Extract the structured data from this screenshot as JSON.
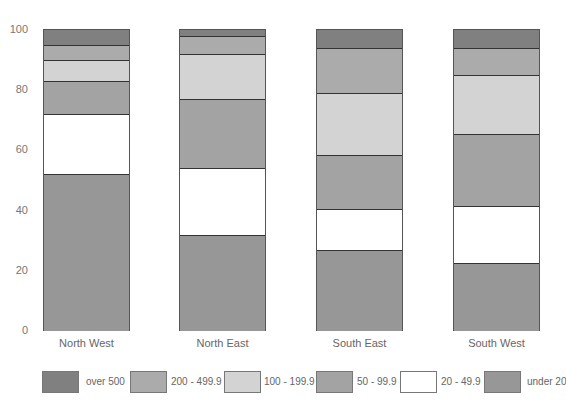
{
  "chart_data": {
    "type": "bar",
    "stacked": true,
    "title": "",
    "xlabel": "",
    "ylabel": "",
    "ylim": [
      0,
      100
    ],
    "yticks": [
      0,
      20,
      40,
      60,
      80,
      100
    ],
    "grid": false,
    "legend_position": "bottom",
    "categories": [
      "North West",
      "North East",
      "South East",
      "South West"
    ],
    "series": [
      {
        "name": "under 20",
        "color": "#979797",
        "values": [
          52,
          32,
          27,
          22.5
        ]
      },
      {
        "name": "20 - 49.9",
        "color": "#ffffff",
        "values": [
          20,
          22,
          13.5,
          19
        ]
      },
      {
        "name": "50 - 99.9",
        "color": "#a3a3a3",
        "values": [
          11,
          23,
          18,
          24
        ]
      },
      {
        "name": "100 - 199.9",
        "color": "#d3d3d3",
        "values": [
          7,
          15,
          20.5,
          19.5
        ]
      },
      {
        "name": "200 - 499.9",
        "color": "#ababab",
        "values": [
          5,
          6,
          15,
          9
        ]
      },
      {
        "name": "over 500",
        "color": "#808080",
        "values": [
          5,
          2,
          6,
          6
        ]
      }
    ]
  },
  "legend": {
    "items": [
      {
        "label": "over 500",
        "color": "#808080"
      },
      {
        "label": "200 - 499.9",
        "color": "#ababab"
      },
      {
        "label": "100 - 199.9",
        "color": "#d3d3d3"
      },
      {
        "label": "50 - 99.9",
        "color": "#a3a3a3"
      },
      {
        "label": "20 - 49.9",
        "color": "#ffffff"
      },
      {
        "label": "under 20",
        "color": "#979797"
      }
    ]
  }
}
